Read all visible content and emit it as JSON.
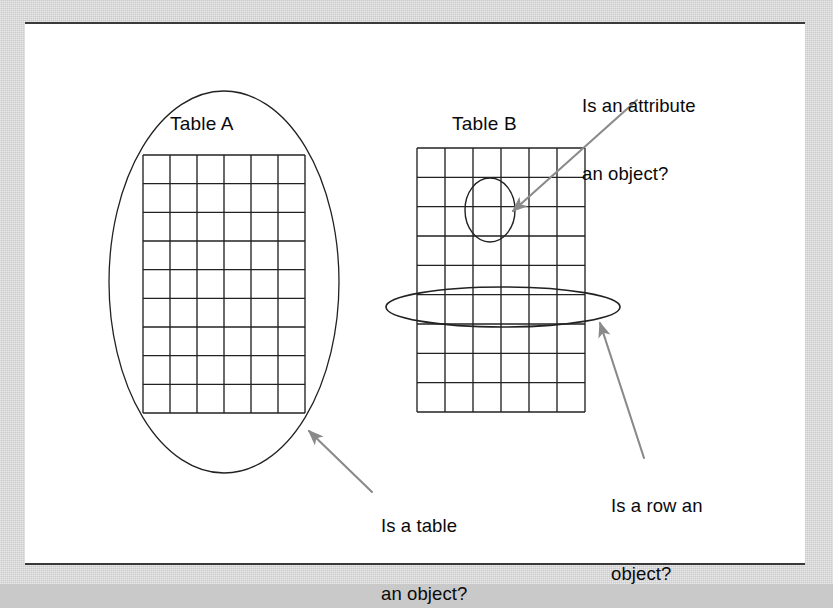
{
  "figure": {
    "kind": "concept-diagram",
    "background_color": "#c9c9c9",
    "page_color": "#ffffff",
    "ink_color": "#1a1a1a",
    "arrow_color": "#8a8a8a"
  },
  "tables": [
    {
      "id": "table-a",
      "title": "Table A",
      "columns": 6,
      "rows": 9,
      "grid": {
        "x": 143,
        "y": 155,
        "width": 162,
        "height": 258
      },
      "title_pos": {
        "x": 170,
        "y": 112
      }
    },
    {
      "id": "table-b",
      "title": "Table B",
      "columns": 6,
      "rows": 9,
      "grid": {
        "x": 417,
        "y": 148,
        "width": 168,
        "height": 264
      },
      "title_pos": {
        "x": 452,
        "y": 112
      }
    }
  ],
  "highlights": [
    {
      "id": "table-a-ellipse",
      "shape": "ellipse",
      "meaning": "whole-table",
      "cx": 224,
      "cy": 282,
      "rx": 115,
      "ry": 191
    },
    {
      "id": "attribute-circle",
      "shape": "ellipse",
      "meaning": "single-attribute-cell",
      "cx": 490,
      "cy": 210,
      "rx": 25,
      "ry": 32
    },
    {
      "id": "row-ellipse",
      "shape": "ellipse",
      "meaning": "single-row",
      "cx": 503,
      "cy": 307,
      "rx": 117,
      "ry": 20
    }
  ],
  "annotations": [
    {
      "id": "attribute-question",
      "line1": "Is an attribute",
      "line2": "an object?",
      "text_pos": {
        "x": 582,
        "y": 50
      },
      "arrow": {
        "x1": 637,
        "y1": 100,
        "x2": 513,
        "y2": 211
      }
    },
    {
      "id": "table-question",
      "line1": "Is a table",
      "line2": "an object?",
      "text_pos": {
        "x": 381,
        "y": 470
      },
      "arrow": {
        "x1": 372,
        "y1": 492,
        "x2": 309,
        "y2": 431
      }
    },
    {
      "id": "row-question",
      "line1": "Is a row an",
      "line2": "object?",
      "text_pos": {
        "x": 611,
        "y": 450
      },
      "arrow": {
        "x1": 644,
        "y1": 458,
        "x2": 600,
        "y2": 323
      }
    }
  ]
}
